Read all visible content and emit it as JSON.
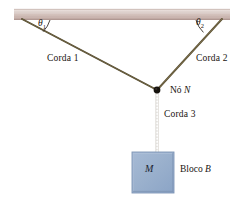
{
  "figure": {
    "background_color": "#ffffff",
    "beam": {
      "name": "teto",
      "color_light": "#ded2cd",
      "color_mid": "#c9b3ad",
      "color_dark": "#b39a94",
      "x": 14,
      "y": 9,
      "width": 216,
      "height": 11
    },
    "ropes": [
      {
        "id": "corda1",
        "label": "Corda 1",
        "color": "#5f5438",
        "from_x": 22,
        "from_y": 19,
        "to_x": 157,
        "to_y": 90
      },
      {
        "id": "corda2",
        "label": "Corda 2",
        "color": "#6b5e3c",
        "from_x": 222,
        "from_y": 19,
        "to_x": 157,
        "to_y": 90
      },
      {
        "id": "corda3",
        "label": "Corda 3",
        "color": "#b4a898",
        "from_x": 157,
        "from_y": 90,
        "to_x": 157,
        "to_y": 152
      }
    ],
    "angles": [
      {
        "id": "theta1",
        "symbol": "θ",
        "subscript": "1"
      },
      {
        "id": "theta2",
        "symbol": "θ",
        "subscript": "2"
      }
    ],
    "node": {
      "id": "no-n",
      "label_prefix": "Nó",
      "label_symbol": "N",
      "x": 157,
      "y": 90,
      "radius": 3.2,
      "color": "#16120d"
    },
    "block": {
      "id": "bloco-b",
      "mass_symbol": "M",
      "label_prefix": "Bloco",
      "label_symbol": "B",
      "x": 132,
      "y": 152,
      "width": 42,
      "height": 41,
      "fill": "#9cb2cf",
      "fill_dark": "#8aa3c4",
      "border": "#7e95b5"
    }
  }
}
